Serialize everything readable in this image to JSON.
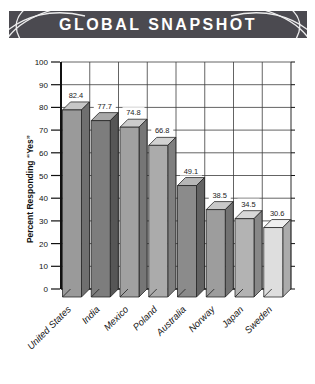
{
  "header": {
    "title": "GLOBAL SNAPSHOT",
    "background_color": "#4b4a50",
    "text_color": "#ffffff"
  },
  "chart_data": {
    "type": "bar",
    "style": "3d-column",
    "title": "GLOBAL SNAPSHOT",
    "categories": [
      "United States",
      "India",
      "Mexico",
      "Poland",
      "Australia",
      "Norway",
      "Japan",
      "Sweden"
    ],
    "values": [
      82.4,
      77.7,
      74.8,
      66.8,
      49.1,
      38.5,
      34.5,
      30.6
    ],
    "value_labels": [
      "82.4",
      "77.7",
      "74.8",
      "66.8",
      "49.1",
      "38.5",
      "34.5",
      "30.6"
    ],
    "xlabel": "",
    "ylabel": "Percent Responding “Yes”",
    "ylim": [
      0,
      100
    ],
    "yticks": [
      0,
      10,
      20,
      30,
      40,
      50,
      60,
      70,
      80,
      90,
      100
    ],
    "grid": "horizontal-and-vertical",
    "legend": "none",
    "axis_color": "#111111",
    "grid_color": "#3c3c3c",
    "bar_colors": [
      {
        "front": "#9a9a9a",
        "side": "#6f6f6f",
        "top": "#c6c6c6"
      },
      {
        "front": "#7d7d7d",
        "side": "#565656",
        "top": "#a9a9a9"
      },
      {
        "front": "#a1a1a1",
        "side": "#767676",
        "top": "#cbcbcb"
      },
      {
        "front": "#ababab",
        "side": "#7f7f7f",
        "top": "#d2d2d2"
      },
      {
        "front": "#8b8b8b",
        "side": "#626262",
        "top": "#b6b6b6"
      },
      {
        "front": "#9d9d9d",
        "side": "#727272",
        "top": "#c8c8c8"
      },
      {
        "front": "#b3b3b3",
        "side": "#888888",
        "top": "#d8d8d8"
      },
      {
        "front": "#dedede",
        "side": "#ababab",
        "top": "#f0f0f0"
      }
    ]
  }
}
